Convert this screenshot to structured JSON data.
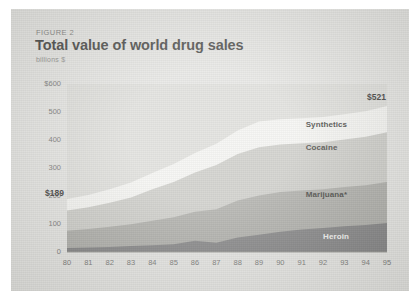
{
  "figure": {
    "number_label": "FIGURE 2",
    "title": "Total value of world drug sales",
    "units": "billions $"
  },
  "callouts": {
    "start": "$189",
    "end": "$521"
  },
  "series_labels": {
    "synthetics": "Synthetics",
    "cocaine": "Cocaine",
    "marijuana": "Marijuana*",
    "heroin": "Heroin"
  },
  "colors": {
    "card_background": "#e3e3e0",
    "plot_background": "#dcdcd8",
    "synthetics": "#f4f4f1",
    "cocaine": "#c9c9c4",
    "marijuana": "#a6a6a1",
    "heroin": "#79797a",
    "text": "#3a3a38",
    "tick_text": "#6f6f6c"
  },
  "chart_data": {
    "type": "area",
    "title": "Total value of world drug sales",
    "subtitle": "FIGURE 2",
    "xlabel": "",
    "ylabel": "billions $",
    "ylim": [
      0,
      600
    ],
    "yticks": [
      0,
      100,
      200,
      300,
      400,
      500,
      600
    ],
    "ytick_labels": [
      "0",
      "100",
      "200",
      "300",
      "400",
      "500",
      "$600"
    ],
    "grid": false,
    "legend": "inline-labels",
    "stacked": true,
    "categories": [
      "80",
      "81",
      "82",
      "83",
      "84",
      "85",
      "86",
      "87",
      "88",
      "89",
      "90",
      "91",
      "92",
      "93",
      "94",
      "95"
    ],
    "series": [
      {
        "name": "Heroin",
        "values": [
          14,
          16,
          18,
          21,
          24,
          28,
          40,
          33,
          52,
          62,
          72,
          80,
          86,
          92,
          96,
          104
        ]
      },
      {
        "name": "Marijuana*",
        "values": [
          62,
          66,
          72,
          78,
          88,
          96,
          104,
          120,
          132,
          140,
          142,
          140,
          138,
          140,
          142,
          146
        ]
      },
      {
        "name": "Cocaine",
        "values": [
          72,
          78,
          86,
          96,
          112,
          126,
          140,
          158,
          166,
          172,
          170,
          168,
          168,
          170,
          174,
          178
        ]
      },
      {
        "name": "Synthetics",
        "values": [
          41,
          44,
          48,
          53,
          58,
          64,
          70,
          76,
          84,
          92,
          90,
          90,
          90,
          90,
          91,
          93
        ]
      }
    ],
    "totals": [
      189,
      204,
      224,
      248,
      282,
      314,
      354,
      387,
      434,
      466,
      474,
      478,
      482,
      492,
      503,
      521
    ],
    "annotations": [
      {
        "text": "$189",
        "x": "80",
        "value": 189
      },
      {
        "text": "$521",
        "x": "95",
        "value": 521
      }
    ]
  }
}
